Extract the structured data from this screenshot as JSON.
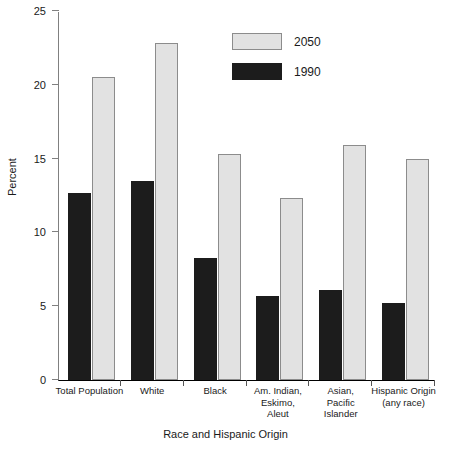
{
  "chart_data": {
    "type": "bar",
    "title": "",
    "xlabel": "Race and Hispanic Origin",
    "ylabel": "Percent",
    "ylim": [
      0,
      25
    ],
    "yticks": [
      0,
      5,
      10,
      15,
      20,
      25
    ],
    "grid": false,
    "legend_position": "top-center",
    "categories": [
      "Total Population",
      "White",
      "Black",
      "Am. Indian,\nEskimo,\nAleut",
      "Asian,\nPacific\nIslander",
      "Hispanic Origin\n(any race)"
    ],
    "category_lines": [
      [
        "Total Population"
      ],
      [
        "White"
      ],
      [
        "Black"
      ],
      [
        "Am. Indian,",
        "Eskimo,",
        "Aleut"
      ],
      [
        "Asian,",
        "Pacific",
        "Islander"
      ],
      [
        "Hispanic Origin",
        "(any race)"
      ]
    ],
    "series": [
      {
        "name": "1990",
        "color": "#1c1c1c",
        "values": [
          12.7,
          13.5,
          8.3,
          5.7,
          6.1,
          5.2
        ]
      },
      {
        "name": "2050",
        "color": "#e2e2e2",
        "values": [
          20.5,
          22.8,
          15.3,
          12.3,
          15.9,
          15.0
        ]
      }
    ]
  },
  "legend": {
    "items": [
      {
        "label": "2050",
        "swatch": "light-gray-swatch"
      },
      {
        "label": "1990",
        "swatch": "black-swatch"
      }
    ]
  },
  "axes": {
    "y_title": "Percent",
    "x_title": "Race and Hispanic Origin",
    "y_tick_labels": [
      "25",
      "20",
      "15",
      "10",
      "5",
      "0"
    ]
  }
}
